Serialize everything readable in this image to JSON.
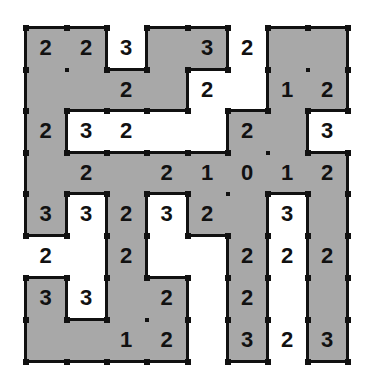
{
  "puzzle": {
    "type": "shading-number-grid",
    "rows": 8,
    "cols": 8,
    "colors": {
      "shaded": "#a8a8a8",
      "white": "#ffffff",
      "line": "#111111"
    },
    "shaded": [
      [
        1,
        1,
        0,
        1,
        1,
        0,
        1,
        1
      ],
      [
        1,
        1,
        1,
        1,
        0,
        0,
        1,
        1
      ],
      [
        1,
        0,
        0,
        0,
        0,
        1,
        1,
        0
      ],
      [
        1,
        1,
        1,
        1,
        1,
        1,
        1,
        1
      ],
      [
        1,
        0,
        1,
        0,
        1,
        1,
        0,
        1
      ],
      [
        0,
        0,
        1,
        0,
        0,
        1,
        0,
        1
      ],
      [
        1,
        0,
        1,
        1,
        0,
        1,
        0,
        1
      ],
      [
        1,
        1,
        1,
        1,
        0,
        1,
        0,
        1
      ]
    ],
    "numbers": [
      [
        "2",
        "2",
        "3",
        "",
        "3",
        "2",
        "",
        ""
      ],
      [
        "",
        "",
        "2",
        "",
        "2",
        "",
        "1",
        "2"
      ],
      [
        "2",
        "3",
        "2",
        "",
        "",
        "2",
        "",
        "3"
      ],
      [
        "",
        "2",
        "",
        "2",
        "1",
        "0",
        "1",
        "2"
      ],
      [
        "3",
        "3",
        "2",
        "3",
        "2",
        "",
        "3",
        ""
      ],
      [
        "2",
        "",
        "2",
        "",
        "",
        "2",
        "2",
        "2"
      ],
      [
        "3",
        "3",
        "",
        "2",
        "",
        "2",
        "",
        ""
      ],
      [
        "",
        "",
        "1",
        "2",
        "",
        "3",
        "2",
        "3"
      ]
    ]
  }
}
